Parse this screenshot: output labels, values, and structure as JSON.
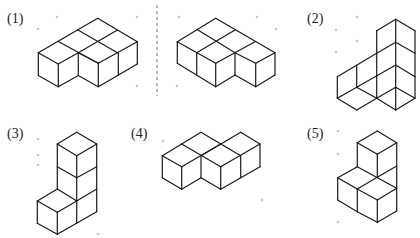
{
  "colors": {
    "edge": "#1a1a1a",
    "dot": "#c8c8c8",
    "divider": "#777777",
    "background": "#ffffff"
  },
  "divider": {
    "x": 157,
    "y1": 5,
    "y2": 96
  },
  "figures": [
    {
      "id": "1",
      "label": "(1)",
      "label_pos": [
        7,
        12
      ],
      "variants": [
        {
          "name": "left-view",
          "edges": [
            [
              [
                97.7,
                18.3
              ],
              [
                38.3,
                52.7
              ]
            ],
            [
              [
                97.7,
                18.3
              ],
              [
                137.3,
                41.7
              ]
            ],
            [
              [
                78,
                30
              ],
              [
                117.5,
                52.7
              ]
            ],
            [
              [
                58.3,
                41.5
              ],
              [
                98.3,
                63.3
              ]
            ],
            [
              [
                117.5,
                30
              ],
              [
                78.3,
                52.7
              ]
            ],
            [
              [
                137.3,
                41.7
              ],
              [
                98.3,
                63.3
              ]
            ],
            [
              [
                38.3,
                52.7
              ],
              [
                58.3,
                64
              ]
            ],
            [
              [
                58.3,
                64
              ],
              [
                78.3,
                52.7
              ]
            ],
            [
              [
                78.3,
                52.7
              ],
              [
                98.3,
                63.3
              ]
            ],
            [
              [
                38.3,
                52.7
              ],
              [
                38.3,
                75.5
              ]
            ],
            [
              [
                58.3,
                64
              ],
              [
                58.3,
                86.7
              ]
            ],
            [
              [
                78.3,
                52.7
              ],
              [
                78.3,
                75.5
              ]
            ],
            [
              [
                98.3,
                63.3
              ],
              [
                98.3,
                86.7
              ]
            ],
            [
              [
                118.3,
                52.7
              ],
              [
                118.3,
                75.3
              ]
            ],
            [
              [
                137.3,
                41.7
              ],
              [
                137.3,
                64
              ]
            ],
            [
              [
                38.3,
                75.5
              ],
              [
                58.3,
                86.7
              ]
            ],
            [
              [
                58.3,
                86.7
              ],
              [
                78.3,
                75.5
              ]
            ],
            [
              [
                78.3,
                75.5
              ],
              [
                98.3,
                86.7
              ]
            ],
            [
              [
                98.3,
                86.7
              ],
              [
                137.3,
                64
              ]
            ]
          ]
        },
        {
          "name": "right-view",
          "edges": [
            [
              [
                215.7,
                18.3
              ],
              [
                177.3,
                41.7
              ]
            ],
            [
              [
                215.7,
                18.3
              ],
              [
                275,
                52.7
              ]
            ],
            [
              [
                196.7,
                29.3
              ],
              [
                235,
                52.7
              ]
            ],
            [
              [
                235,
                30
              ],
              [
                196.7,
                52.7
              ]
            ],
            [
              [
                255,
                41.7
              ],
              [
                215.7,
                63.3
              ]
            ],
            [
              [
                177.3,
                41.7
              ],
              [
                215.7,
                63.3
              ]
            ],
            [
              [
                235,
                52.7
              ],
              [
                255.7,
                63.3
              ]
            ],
            [
              [
                255.7,
                63.3
              ],
              [
                275,
                52.7
              ]
            ],
            [
              [
                177.3,
                41.7
              ],
              [
                177.3,
                63.3
              ]
            ],
            [
              [
                196.7,
                52.7
              ],
              [
                196.7,
                75
              ]
            ],
            [
              [
                215.7,
                63.3
              ],
              [
                215.7,
                86.7
              ]
            ],
            [
              [
                235,
                52.7
              ],
              [
                235,
                75
              ]
            ],
            [
              [
                255.7,
                63.3
              ],
              [
                255.7,
                86.7
              ]
            ],
            [
              [
                275,
                52.7
              ],
              [
                275,
                75
              ]
            ],
            [
              [
                177.3,
                63.3
              ],
              [
                215.7,
                86.7
              ]
            ],
            [
              [
                215.7,
                86.7
              ],
              [
                235,
                75
              ]
            ],
            [
              [
                235,
                75
              ],
              [
                255.7,
                86.7
              ]
            ],
            [
              [
                255.7,
                86.7
              ],
              [
                275,
                75
              ]
            ]
          ]
        }
      ]
    },
    {
      "id": "2",
      "label": "(2)",
      "label_pos": [
        307,
        12
      ],
      "edges": [
        [
          [
            395.7,
            19.3
          ],
          [
            376.7,
            30.7
          ]
        ],
        [
          [
            395.7,
            19.3
          ],
          [
            415,
            30.7
          ]
        ],
        [
          [
            376.7,
            30.7
          ],
          [
            376.7,
            98.3
          ]
        ],
        [
          [
            395.7,
            19.3
          ],
          [
            395.7,
            110
          ]
        ],
        [
          [
            415,
            30.7
          ],
          [
            415,
            98.3
          ]
        ],
        [
          [
            376.7,
            53.3
          ],
          [
            395.7,
            42.3
          ]
        ],
        [
          [
            395.7,
            42.3
          ],
          [
            415,
            53.3
          ]
        ],
        [
          [
            337.3,
            76.7
          ],
          [
            376.7,
            53.3
          ]
        ],
        [
          [
            356.7,
            65
          ],
          [
            356.7,
            87.3
          ]
        ],
        [
          [
            337.3,
            76.7
          ],
          [
            337.3,
            98.3
          ]
        ],
        [
          [
            356.7,
            87.3
          ],
          [
            395.7,
            65
          ]
        ],
        [
          [
            395.7,
            65
          ],
          [
            415,
            76.7
          ]
        ],
        [
          [
            337.3,
            98.3
          ],
          [
            356.7,
            110
          ]
        ],
        [
          [
            356.7,
            110
          ],
          [
            376.7,
            98.3
          ]
        ],
        [
          [
            356.7,
            87.3
          ],
          [
            376.7,
            98.3
          ]
        ],
        [
          [
            337.3,
            98.3
          ],
          [
            356.7,
            87.3
          ]
        ],
        [
          [
            376.7,
            98.3
          ],
          [
            395.7,
            110
          ]
        ],
        [
          [
            395.7,
            110
          ],
          [
            415,
            98.3
          ]
        ],
        [
          [
            376.7,
            98.3
          ],
          [
            395.7,
            87.3
          ]
        ],
        [
          [
            395.7,
            87.3
          ],
          [
            415,
            98.3
          ]
        ]
      ]
    },
    {
      "id": "3",
      "label": "(3)",
      "label_pos": [
        7,
        127
      ],
      "edges": [
        [
          [
            76.7,
            132.3
          ],
          [
            57.3,
            144
          ]
        ],
        [
          [
            76.7,
            132.3
          ],
          [
            96.7,
            144
          ]
        ],
        [
          [
            57.3,
            144
          ],
          [
            76.7,
            155.7
          ]
        ],
        [
          [
            76.7,
            155.7
          ],
          [
            96.7,
            144
          ]
        ],
        [
          [
            57.3,
            144
          ],
          [
            57.3,
            189
          ]
        ],
        [
          [
            76.7,
            155.7
          ],
          [
            76.7,
            223.3
          ]
        ],
        [
          [
            96.7,
            144
          ],
          [
            96.7,
            211.7
          ]
        ],
        [
          [
            57.3,
            166.7
          ],
          [
            76.7,
            177.7
          ]
        ],
        [
          [
            76.7,
            177.7
          ],
          [
            96.7,
            166.7
          ]
        ],
        [
          [
            76.7,
            201
          ],
          [
            96.7,
            189
          ]
        ],
        [
          [
            37.3,
            201
          ],
          [
            57.3,
            189
          ]
        ],
        [
          [
            57.3,
            189
          ],
          [
            76.7,
            201
          ]
        ],
        [
          [
            37.3,
            201
          ],
          [
            57.3,
            212.3
          ]
        ],
        [
          [
            57.3,
            212.3
          ],
          [
            76.7,
            201
          ]
        ],
        [
          [
            37.3,
            201
          ],
          [
            37.3,
            223.3
          ]
        ],
        [
          [
            57.3,
            212.3
          ],
          [
            57.3,
            234.3
          ]
        ],
        [
          [
            37.3,
            223.3
          ],
          [
            57.3,
            234.3
          ]
        ],
        [
          [
            57.3,
            234.3
          ],
          [
            96.7,
            211.7
          ]
        ]
      ]
    },
    {
      "id": "4",
      "label": "(4)",
      "label_pos": [
        131,
        127
      ],
      "edges": [
        [
          [
            201,
            132.3
          ],
          [
            162.3,
            155.7
          ]
        ],
        [
          [
            201,
            132.3
          ],
          [
            240.7,
            155.7
          ]
        ],
        [
          [
            240.7,
            132.3
          ],
          [
            201,
            155.7
          ]
        ],
        [
          [
            240.7,
            132.3
          ],
          [
            260,
            144
          ]
        ],
        [
          [
            220.7,
            144
          ],
          [
            181.7,
            166.7
          ]
        ],
        [
          [
            260,
            144
          ],
          [
            220.7,
            166.7
          ]
        ],
        [
          [
            181.7,
            144
          ],
          [
            220.7,
            166.7
          ]
        ],
        [
          [
            162.3,
            155.7
          ],
          [
            181.7,
            166.7
          ]
        ],
        [
          [
            162.3,
            155.7
          ],
          [
            162.3,
            177.7
          ]
        ],
        [
          [
            181.7,
            166.7
          ],
          [
            181.7,
            189.3
          ]
        ],
        [
          [
            201,
            155.7
          ],
          [
            201,
            177.7
          ]
        ],
        [
          [
            220.7,
            166.7
          ],
          [
            220.7,
            189.3
          ]
        ],
        [
          [
            240.7,
            155.7
          ],
          [
            240.7,
            177.7
          ]
        ],
        [
          [
            260,
            144
          ],
          [
            260,
            166.7
          ]
        ],
        [
          [
            162.3,
            177.7
          ],
          [
            181.7,
            189.3
          ]
        ],
        [
          [
            181.7,
            189.3
          ],
          [
            201,
            177.7
          ]
        ],
        [
          [
            201,
            177.7
          ],
          [
            220.7,
            189.3
          ]
        ],
        [
          [
            220.7,
            189.3
          ],
          [
            260,
            166.7
          ]
        ]
      ]
    },
    {
      "id": "5",
      "label": "(5)",
      "label_pos": [
        307,
        127
      ],
      "edges": [
        [
          [
            377.3,
            131
          ],
          [
            357.3,
            142.7
          ]
        ],
        [
          [
            377.3,
            131
          ],
          [
            396.7,
            142.7
          ]
        ],
        [
          [
            357.3,
            142.7
          ],
          [
            377.3,
            154.3
          ]
        ],
        [
          [
            377.3,
            154.3
          ],
          [
            396.7,
            142.7
          ]
        ],
        [
          [
            357.3,
            142.7
          ],
          [
            357.3,
            166.7
          ]
        ],
        [
          [
            377.3,
            154.3
          ],
          [
            377.3,
            177.3
          ]
        ],
        [
          [
            396.7,
            142.7
          ],
          [
            396.7,
            211
          ]
        ],
        [
          [
            377.3,
            177.3
          ],
          [
            396.7,
            166
          ]
        ],
        [
          [
            337.7,
            177.7
          ],
          [
            357.3,
            166.7
          ]
        ],
        [
          [
            357.3,
            166.7
          ],
          [
            396.7,
            188.3
          ]
        ],
        [
          [
            337.7,
            177.7
          ],
          [
            357.3,
            189
          ]
        ],
        [
          [
            357.3,
            189
          ],
          [
            377.3,
            177.3
          ]
        ],
        [
          [
            357.3,
            189
          ],
          [
            377.3,
            200
          ]
        ],
        [
          [
            377.3,
            200
          ],
          [
            396.7,
            188.3
          ]
        ],
        [
          [
            337.7,
            177.7
          ],
          [
            337.7,
            200
          ]
        ],
        [
          [
            357.3,
            189
          ],
          [
            357.3,
            211.7
          ]
        ],
        [
          [
            377.3,
            200
          ],
          [
            377.3,
            222.3
          ]
        ],
        [
          [
            337.7,
            200
          ],
          [
            357.3,
            211.7
          ]
        ],
        [
          [
            357.3,
            211.7
          ],
          [
            377.3,
            222.3
          ]
        ],
        [
          [
            377.3,
            222.3
          ],
          [
            396.7,
            211
          ]
        ]
      ]
    }
  ],
  "dots": [
    [
      57,
      17
    ],
    [
      38,
      29
    ],
    [
      137,
      17
    ],
    [
      137,
      86
    ],
    [
      179,
      17
    ],
    [
      257,
      17
    ],
    [
      276,
      29
    ],
    [
      177,
      86
    ],
    [
      357,
      17
    ],
    [
      336,
      30
    ],
    [
      357,
      41
    ],
    [
      336,
      52
    ],
    [
      38,
      139
    ],
    [
      38,
      155
    ],
    [
      38,
      165
    ],
    [
      98,
      234
    ],
    [
      163,
      141
    ],
    [
      262,
      200
    ],
    [
      338,
      131
    ],
    [
      338,
      154
    ],
    [
      338,
      222
    ]
  ]
}
